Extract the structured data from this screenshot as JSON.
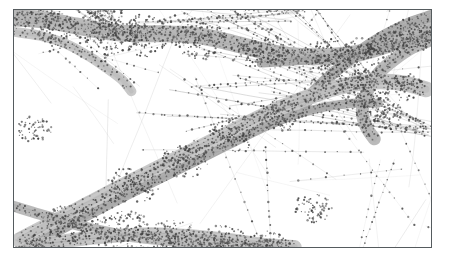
{
  "figure": {
    "type": "gps-trajectory-map",
    "title": "",
    "caption": "",
    "background_color": "#ffffff",
    "frame": {
      "border_color": "#555b5e",
      "border_width_px": 1.2,
      "x": 13,
      "y": 9,
      "width": 419,
      "height": 239
    }
  },
  "legend": {
    "visible": false,
    "entries": []
  },
  "axes": {
    "visible": false,
    "x_tick_labels": [],
    "y_tick_labels": [],
    "xlabel": "",
    "ylabel": "",
    "grid": false
  },
  "style": {
    "corridor_fill": "#b4b4b4",
    "corridor_fill_light": "#c4c4c4",
    "corridor_fill_dark": "#a4a4a4",
    "trajectory_line": "#a9a9a9",
    "trajectory_line_faint": "#c2c2c2",
    "point_marker": "#3f3f3f",
    "point_marker_soft": "#585858",
    "point_radius_px": 0.85,
    "line_width_px": 0.45
  },
  "chart_data": {
    "type": "scatter",
    "title": "",
    "xlabel": "",
    "ylabel": "",
    "xlim": [
      0,
      419
    ],
    "ylim": [
      0,
      239
    ],
    "grid": false,
    "legend_position": "none",
    "corridors": [
      {
        "name": "north-west-trunk",
        "width": 17,
        "path": [
          [
            0,
            8
          ],
          [
            30,
            10
          ],
          [
            62,
            16
          ],
          [
            96,
            22
          ],
          [
            124,
            24
          ],
          [
            152,
            24
          ],
          [
            186,
            26
          ],
          [
            214,
            32
          ],
          [
            246,
            40
          ],
          [
            278,
            46
          ],
          [
            312,
            47
          ],
          [
            344,
            44
          ],
          [
            372,
            36
          ],
          [
            398,
            26
          ],
          [
            419,
            18
          ]
        ]
      },
      {
        "name": "north-west-trunk-branch",
        "width": 10,
        "path": [
          [
            0,
            22
          ],
          [
            26,
            26
          ],
          [
            52,
            34
          ],
          [
            74,
            46
          ],
          [
            92,
            58
          ],
          [
            108,
            70
          ],
          [
            118,
            82
          ]
        ]
      },
      {
        "name": "north-east-ramp",
        "width": 12,
        "path": [
          [
            419,
            6
          ],
          [
            396,
            14
          ],
          [
            372,
            26
          ],
          [
            350,
            40
          ],
          [
            330,
            56
          ],
          [
            314,
            70
          ],
          [
            300,
            84
          ],
          [
            292,
            96
          ]
        ]
      },
      {
        "name": "east-interchange-loop",
        "width": 13,
        "path": [
          [
            419,
            30
          ],
          [
            400,
            38
          ],
          [
            382,
            50
          ],
          [
            368,
            62
          ],
          [
            358,
            76
          ],
          [
            352,
            90
          ],
          [
            350,
            104
          ],
          [
            354,
            118
          ],
          [
            362,
            130
          ]
        ]
      },
      {
        "name": "main-diagonal-arterial",
        "width": 16,
        "path": [
          [
            6,
            232
          ],
          [
            40,
            214
          ],
          [
            76,
            195
          ],
          [
            112,
            176
          ],
          [
            148,
            158
          ],
          [
            184,
            140
          ],
          [
            220,
            122
          ],
          [
            256,
            104
          ],
          [
            290,
            90
          ],
          [
            318,
            80
          ],
          [
            344,
            74
          ],
          [
            368,
            72
          ],
          [
            392,
            74
          ],
          [
            414,
            80
          ]
        ]
      },
      {
        "name": "main-diagonal-parallel",
        "width": 9,
        "path": [
          [
            2,
            246
          ],
          [
            36,
            228
          ],
          [
            72,
            209
          ],
          [
            108,
            190
          ],
          [
            144,
            172
          ],
          [
            180,
            154
          ],
          [
            216,
            136
          ],
          [
            250,
            119
          ],
          [
            282,
            106
          ],
          [
            312,
            98
          ],
          [
            340,
            94
          ],
          [
            366,
            94
          ]
        ]
      },
      {
        "name": "south-west-feeder",
        "width": 11,
        "path": [
          [
            0,
            198
          ],
          [
            26,
            206
          ],
          [
            54,
            214
          ],
          [
            84,
            222
          ],
          [
            116,
            228
          ],
          [
            150,
            232
          ],
          [
            186,
            235
          ],
          [
            222,
            237
          ],
          [
            258,
            238
          ]
        ]
      },
      {
        "name": "south-braid",
        "width": 14,
        "path": [
          [
            18,
            238
          ],
          [
            58,
            232
          ],
          [
            98,
            228
          ],
          [
            138,
            226
          ],
          [
            178,
            228
          ],
          [
            218,
            232
          ],
          [
            252,
            237
          ],
          [
            282,
            239
          ]
        ]
      },
      {
        "name": "east-horizontal-band",
        "width": 8,
        "path": [
          [
            248,
            54
          ],
          [
            280,
            52
          ],
          [
            312,
            49
          ],
          [
            344,
            45
          ],
          [
            376,
            38
          ],
          [
            404,
            30
          ],
          [
            419,
            25
          ]
        ]
      }
    ],
    "trajectory_bundles": [
      {
        "name": "nw-fan",
        "count": 26,
        "origin": [
          96,
          20
        ],
        "spread_deg": 54,
        "mean_heading_deg": 226,
        "length": 190
      },
      {
        "name": "left-vertical-tracks",
        "count": 14,
        "origin": [
          48,
          4
        ],
        "spread_deg": 16,
        "mean_heading_deg": 182,
        "length": 230
      },
      {
        "name": "center-vertical-tracks",
        "count": 11,
        "origin": [
          286,
          4
        ],
        "spread_deg": 14,
        "mean_heading_deg": 178,
        "length": 235
      },
      {
        "name": "diagonal-cross-bundle",
        "count": 22,
        "origin": [
          10,
          236
        ],
        "spread_deg": 34,
        "mean_heading_deg": 28,
        "length": 300
      },
      {
        "name": "east-horizontal-fan",
        "count": 18,
        "origin": [
          419,
          120
        ],
        "spread_deg": 30,
        "mean_heading_deg": 196,
        "length": 260
      },
      {
        "name": "south-braid-bundle",
        "count": 30,
        "origin": [
          4,
          246
        ],
        "spread_deg": 20,
        "mean_heading_deg": 12,
        "length": 330
      },
      {
        "name": "interchange-ramps",
        "count": 16,
        "origin": [
          352,
          70
        ],
        "spread_deg": 70,
        "mean_heading_deg": 200,
        "length": 170
      }
    ],
    "point_count_estimate": 2400,
    "marker_spacing_px": 6
  }
}
